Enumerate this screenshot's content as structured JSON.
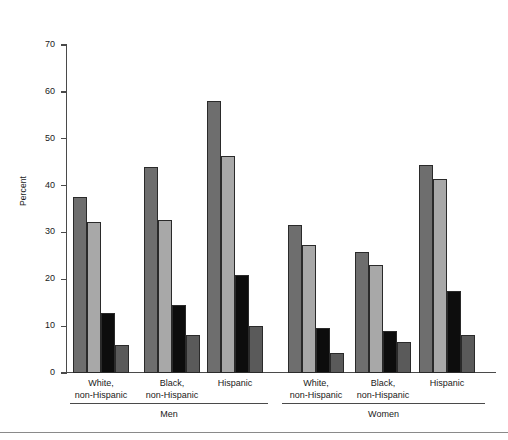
{
  "chart_data": {
    "type": "bar",
    "title": "",
    "xlabel": "",
    "ylabel": "Percent",
    "ylim": [
      0,
      70
    ],
    "ytick_step": 10,
    "yticks": [
      0,
      10,
      20,
      30,
      40,
      50,
      60,
      70
    ],
    "grid": false,
    "legend": "none",
    "bar_count_per_group": 4,
    "sections": [
      {
        "name": "Men",
        "categories": [
          {
            "line1": "White,",
            "line2": "non-Hispanic"
          },
          {
            "line1": "Black,",
            "line2": "non-Hispanic"
          },
          {
            "line1": "Hispanic",
            "line2": ""
          }
        ]
      },
      {
        "name": "Women",
        "categories": [
          {
            "line1": "White,",
            "line2": "non-Hispanic"
          },
          {
            "line1": "Black,",
            "line2": "non-Hispanic"
          },
          {
            "line1": "Hispanic",
            "line2": ""
          }
        ]
      }
    ],
    "categories": [
      "Men / White, non-Hispanic",
      "Men / Black, non-Hispanic",
      "Men / Hispanic",
      "Women / White, non-Hispanic",
      "Women / Black, non-Hispanic",
      "Women / Hispanic"
    ],
    "series": [
      {
        "name": "series-1",
        "color": "#6e6e6e",
        "values": [
          37.5,
          44.0,
          58.0,
          31.6,
          25.8,
          44.5
        ]
      },
      {
        "name": "series-2",
        "color": "#a8a8a8",
        "values": [
          32.2,
          32.7,
          46.4,
          27.3,
          23.0,
          41.3
        ]
      },
      {
        "name": "series-3",
        "color": "#0d0d0d",
        "values": [
          12.9,
          14.5,
          20.9,
          9.6,
          9.0,
          17.5
        ]
      },
      {
        "name": "series-4",
        "color": "#5a5a5a",
        "values": [
          5.9,
          8.1,
          10.0,
          4.3,
          6.7,
          8.1
        ]
      }
    ],
    "colors": {
      "series_1": "#6e6e6e",
      "series_2": "#a8a8a8",
      "series_3": "#0d0d0d",
      "series_4": "#5a5a5a",
      "axis": "#4a4a4a",
      "bar_outline": "#2a2a2a",
      "background": "#ffffff"
    }
  }
}
